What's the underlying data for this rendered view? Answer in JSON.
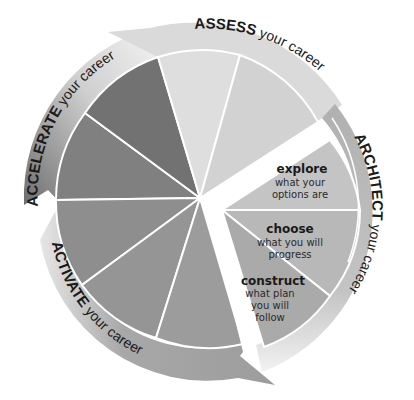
{
  "diagram": {
    "type": "career-cycle-wheel",
    "phases": [
      {
        "id": "assess",
        "bold": "ASSESS",
        "rest": " your career",
        "color": "#d9d9d9",
        "ring_color": "#dcdcdc"
      },
      {
        "id": "architect",
        "bold": "ARCHITECT",
        "rest": " your career",
        "color": "#bcbcbc",
        "ring_color": "#b3b3b3"
      },
      {
        "id": "activate",
        "bold": "ACTIVATE",
        "rest": " your career",
        "color": "#9a9a9a",
        "ring_color": "#a8a8a8"
      },
      {
        "id": "accelerate",
        "bold": "ACCELERATE",
        "rest": " your career",
        "color": "#707070",
        "ring_color": "#8a8a8a"
      }
    ],
    "architect_steps": [
      {
        "title": "explore",
        "lines": [
          "what your",
          "options are"
        ]
      },
      {
        "title": "choose",
        "lines": [
          "what you will",
          "progress"
        ]
      },
      {
        "title": "construct",
        "lines": [
          "what plan",
          "you will",
          "follow"
        ]
      }
    ]
  }
}
